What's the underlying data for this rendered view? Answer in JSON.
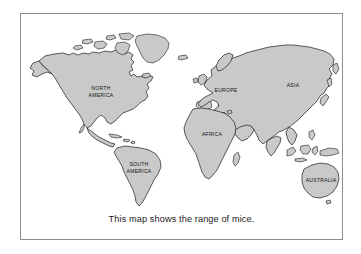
{
  "figure": {
    "type": "world-map-illustration",
    "caption": "This map shows the range of mice.",
    "frame_border_color": "#8d8d8d",
    "land_fill_color": "#c9c9c9",
    "land_outline_color": "#1c1c1c",
    "background_color": "#ffffff"
  },
  "map": {
    "labels": [
      {
        "id": "north-america",
        "line1": "NORTH",
        "line2": "AMERICA",
        "x": 80,
        "y": 78
      },
      {
        "id": "south-america",
        "line1": "SOUTH",
        "line2": "AMERICA",
        "x": 118,
        "y": 154
      },
      {
        "id": "europe",
        "line1": "EUROPE",
        "line2": "",
        "x": 205,
        "y": 77
      },
      {
        "id": "asia",
        "line1": "ASIA",
        "line2": "",
        "x": 272,
        "y": 72
      },
      {
        "id": "africa",
        "line1": "AFRICA",
        "line2": "",
        "x": 193,
        "y": 121
      },
      {
        "id": "australia",
        "line1": "AUSTRALIA",
        "line2": "",
        "x": 303,
        "y": 174
      }
    ]
  }
}
